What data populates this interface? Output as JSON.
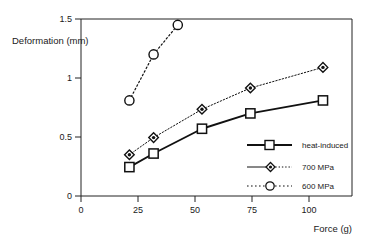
{
  "chart_data": {
    "type": "line",
    "title": "",
    "xlabel": "Force (g)",
    "ylabel": "Deformation (mm)",
    "xlim": [
      0,
      112
    ],
    "ylim": [
      0,
      1.5
    ],
    "xticks": [
      0,
      25,
      50,
      75,
      100
    ],
    "xtick_labels": [
      "0",
      "25",
      "50",
      "75",
      "100"
    ],
    "yticks": [
      0,
      0.5,
      1,
      1.5
    ],
    "ytick_labels": [
      "0",
      "0.5",
      "1",
      "1.5"
    ],
    "grid": false,
    "legend_position": "inside-bottom-right",
    "series": [
      {
        "name": "heat-induced",
        "marker": "square-open",
        "linestyle": "solid",
        "linewidth": 1.8,
        "color": "#111111",
        "x": [
          20,
          30,
          50,
          70,
          100
        ],
        "values": [
          0.245,
          0.36,
          0.57,
          0.7,
          0.81
        ]
      },
      {
        "name": "700 MPa",
        "marker": "diamond-filled-center",
        "linestyle": "dotted",
        "linewidth": 1.0,
        "color": "#111111",
        "x": [
          20,
          30,
          50,
          70,
          100
        ],
        "values": [
          0.35,
          0.495,
          0.735,
          0.915,
          1.09
        ]
      },
      {
        "name": "600 MPa",
        "marker": "circle-open",
        "linestyle": "dotted",
        "linewidth": 1.2,
        "color": "#111111",
        "x": [
          20,
          30,
          40
        ],
        "values": [
          0.81,
          1.2,
          1.45
        ]
      }
    ]
  },
  "axes": {
    "y_label": "Deformation (mm)",
    "x_label": "Force (g)",
    "y_ticks": [
      "1.5",
      "1",
      "0.5",
      "0"
    ],
    "x_ticks": [
      "0",
      "25",
      "50",
      "75",
      "100"
    ]
  },
  "legend": {
    "items": [
      {
        "label": "heat-induced"
      },
      {
        "label": "700 MPa"
      },
      {
        "label": "600 MPa"
      }
    ]
  },
  "colors": {
    "ink": "#111111",
    "background": "#ffffff"
  }
}
